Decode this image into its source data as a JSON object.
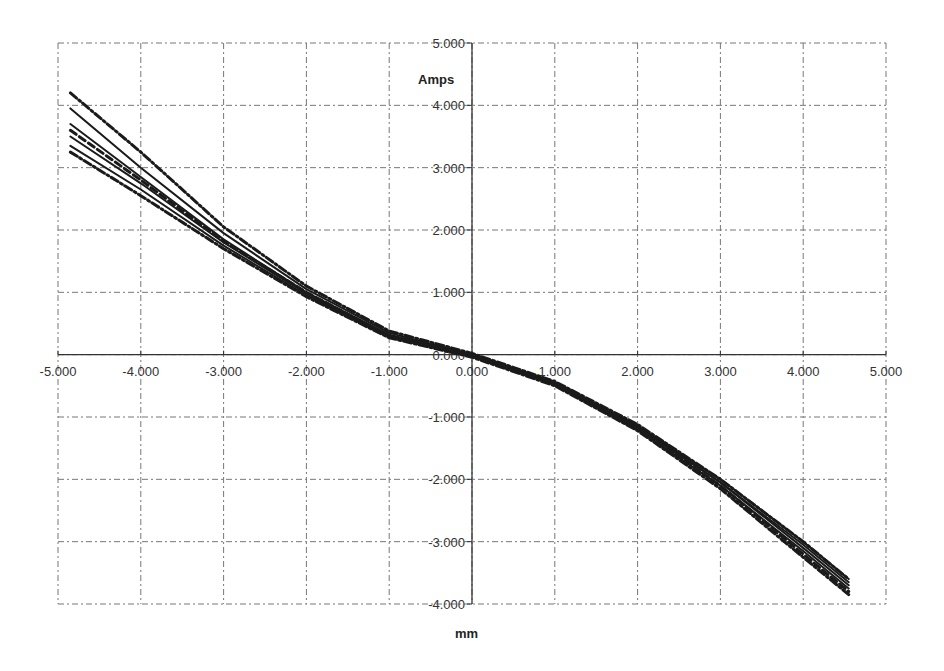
{
  "chart_data": {
    "type": "line",
    "title": "",
    "xlabel": "mm",
    "ylabel": "Amps",
    "xlim": [
      -5,
      5
    ],
    "ylim": [
      -4,
      5
    ],
    "grid": true,
    "legend": "none",
    "x_ticks": [
      "-5.000",
      "-4.000",
      "-3.000",
      "-2.000",
      "-1.000",
      "0.000",
      "1.000",
      "2.000",
      "3.000",
      "4.000",
      "5.000"
    ],
    "y_ticks": [
      "5.000",
      "4.000",
      "3.000",
      "2.000",
      "1.000",
      "0.000",
      "-1.000",
      "-2.000",
      "-3.000",
      "-4.000"
    ],
    "series": [
      {
        "name": "run-1",
        "style": "solid",
        "x": [
          -4.85,
          -4,
          -3,
          -2,
          -1,
          0,
          1,
          2,
          3,
          4,
          4.55
        ],
        "y": [
          3.95,
          3.0,
          1.95,
          1.05,
          0.35,
          0.0,
          -0.45,
          -1.15,
          -2.05,
          -3.05,
          -3.65
        ]
      },
      {
        "name": "run-2",
        "style": "solid",
        "x": [
          -4.85,
          -4,
          -3,
          -2,
          -1,
          0,
          1,
          2,
          3,
          4,
          4.55
        ],
        "y": [
          3.7,
          2.85,
          1.85,
          1.0,
          0.32,
          0.0,
          -0.45,
          -1.15,
          -2.0,
          -3.0,
          -3.6
        ]
      },
      {
        "name": "run-3",
        "style": "solid",
        "x": [
          -4.85,
          -4,
          -3,
          -2,
          -1,
          0,
          1,
          2,
          3,
          4,
          4.55
        ],
        "y": [
          3.5,
          2.75,
          1.8,
          0.98,
          0.3,
          -0.02,
          -0.47,
          -1.17,
          -2.05,
          -3.1,
          -3.7
        ]
      },
      {
        "name": "run-4",
        "style": "solid",
        "x": [
          -4.85,
          -4,
          -3,
          -2,
          -1,
          0,
          1,
          2,
          3,
          4,
          4.55
        ],
        "y": [
          3.35,
          2.65,
          1.75,
          0.95,
          0.28,
          -0.03,
          -0.48,
          -1.2,
          -2.1,
          -3.15,
          -3.75
        ]
      },
      {
        "name": "run-5",
        "style": "dashdot",
        "x": [
          -4.85,
          -4,
          -3,
          -2,
          -1,
          0,
          1,
          2,
          3,
          4,
          4.55
        ],
        "y": [
          4.2,
          3.25,
          2.05,
          1.1,
          0.38,
          0.02,
          -0.43,
          -1.12,
          -2.0,
          -3.0,
          -3.6
        ]
      },
      {
        "name": "run-6",
        "style": "dashdot",
        "x": [
          -4.85,
          -4,
          -3,
          -2,
          -1,
          0,
          1,
          2,
          3,
          4,
          4.55
        ],
        "y": [
          3.25,
          2.55,
          1.7,
          0.93,
          0.27,
          -0.04,
          -0.5,
          -1.22,
          -2.15,
          -3.25,
          -3.85
        ]
      },
      {
        "name": "run-7",
        "style": "dashed",
        "x": [
          -4.85,
          -4,
          -3,
          -2,
          -1,
          0,
          1,
          2,
          3,
          4,
          4.55
        ],
        "y": [
          3.6,
          2.8,
          1.82,
          1.0,
          0.3,
          -0.01,
          -0.46,
          -1.18,
          -2.1,
          -3.2,
          -3.8
        ]
      }
    ]
  }
}
